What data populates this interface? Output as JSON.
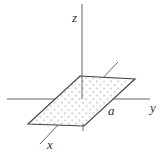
{
  "diagram": {
    "title": "",
    "labels": {
      "z_axis": "z",
      "y_axis": "y",
      "x_axis": "x",
      "side_length": "a"
    },
    "region": {
      "shape": "parallelogram",
      "fill": "dotted",
      "plane": "xy"
    },
    "colors": {
      "line": "#555555",
      "dots": "#444444",
      "background": "#ffffff"
    }
  }
}
